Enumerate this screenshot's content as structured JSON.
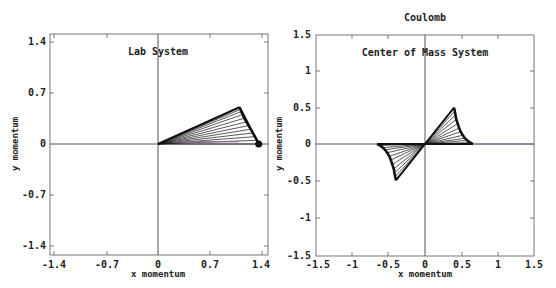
{
  "suptitle": "Coulomb",
  "chart_data": [
    {
      "type": "line",
      "title": "Lab System",
      "xlabel": "x momentum",
      "ylabel": "y momentum",
      "xlim": [
        -1.5,
        1.5
      ],
      "ylim": [
        -1.5,
        1.5
      ],
      "xticks": [
        "-1.4",
        "-0.7",
        "0",
        "0.7",
        "1.4"
      ],
      "yticks": [
        "1.4",
        "0.7",
        "0",
        "-0.7",
        "-1.4"
      ],
      "xtick_values": [
        -1.4,
        -0.7,
        0,
        0.7,
        1.4
      ],
      "ytick_values": [
        1.4,
        0.7,
        0,
        -0.7,
        -1.4
      ],
      "grid": false,
      "description": "Momentum vector fan: lines from origin to particle-1 momentum and from particle-1 momentum to total momentum (1.37, 0)",
      "total_momentum": [
        1.37,
        0.0
      ],
      "series": [
        {
          "name": "p1 endpoints",
          "x": [
            1.37,
            1.35,
            1.32,
            1.29,
            1.26,
            1.23,
            1.2,
            1.17,
            1.15,
            1.13,
            1.12,
            1.11
          ],
          "y": [
            0.0,
            0.05,
            0.1,
            0.15,
            0.2,
            0.25,
            0.3,
            0.35,
            0.4,
            0.44,
            0.47,
            0.5
          ]
        }
      ]
    },
    {
      "type": "line",
      "title": "Center of Mass System",
      "xlabel": "x momentum",
      "ylabel": "y momentum",
      "xlim": [
        -1.5,
        1.5
      ],
      "ylim": [
        -1.5,
        1.5
      ],
      "xticks": [
        "-1.5",
        "-1",
        "-0.5",
        "0",
        "0.5",
        "1",
        "1.5"
      ],
      "yticks": [
        "1.5",
        "1",
        "0.5",
        "0",
        "-0.5",
        "-1",
        "-1.5"
      ],
      "xtick_values": [
        -1.5,
        -1,
        -0.5,
        0,
        0.5,
        1,
        1.5
      ],
      "ytick_values": [
        1.5,
        1,
        0.5,
        0,
        -0.5,
        -1,
        -1.5
      ],
      "grid": false,
      "description": "Momentum vectors from origin for particle 1 and particle 2 (p2 = -p1)",
      "series": [
        {
          "name": "p1 endpoints",
          "x": [
            0.66,
            0.62,
            0.58,
            0.55,
            0.52,
            0.49,
            0.47,
            0.45,
            0.43,
            0.42,
            0.41,
            0.4
          ],
          "y": [
            0.0,
            0.02,
            0.05,
            0.08,
            0.12,
            0.17,
            0.22,
            0.28,
            0.34,
            0.4,
            0.45,
            0.5
          ]
        },
        {
          "name": "p2 endpoints",
          "x": [
            -0.66,
            -0.62,
            -0.58,
            -0.55,
            -0.52,
            -0.49,
            -0.47,
            -0.45,
            -0.43,
            -0.42,
            -0.41,
            -0.4
          ],
          "y": [
            0.0,
            -0.02,
            -0.05,
            -0.08,
            -0.12,
            -0.17,
            -0.22,
            -0.28,
            -0.34,
            -0.4,
            -0.45,
            -0.5
          ]
        }
      ]
    }
  ],
  "plots": [
    {
      "title": "Lab System",
      "xlabel": "x momentum",
      "ylabel": "y momentum",
      "xticks": [
        "-1.4",
        "-0.7",
        "0",
        "0.7",
        "1.4"
      ],
      "yticks": [
        "1.4",
        "0.7",
        "0",
        "-0.7",
        "-1.4"
      ]
    },
    {
      "title": "Center of Mass System",
      "xlabel": "x momentum",
      "ylabel": "y momentum",
      "xticks": [
        "-1.5",
        "-1",
        "-0.5",
        "0",
        "0.5",
        "1",
        "1.5"
      ],
      "yticks": [
        "1.5",
        "1",
        "0.5",
        "0",
        "-0.5",
        "-1",
        "-1.5"
      ]
    }
  ],
  "colors": {
    "frame": "#777777",
    "trace": "#111111",
    "accent_trace": "#8a5a9a"
  }
}
